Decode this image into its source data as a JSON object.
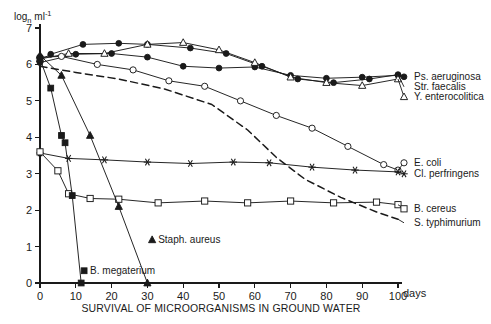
{
  "chart_data": {
    "type": "line",
    "title": "",
    "xlabel": "SURVIVAL OF MICROORGANISMS IN GROUND WATER",
    "ylabel": "log",
    "ylabel_sub": "n",
    "ylabel_unit": " ml",
    "ylabel_exp": "-1",
    "x_unit_label": "days",
    "xlim": [
      0,
      100
    ],
    "ylim": [
      0,
      7
    ],
    "grid": false,
    "legend_position": "right-inline",
    "xticks": [
      0,
      10,
      20,
      30,
      40,
      50,
      60,
      70,
      80,
      90,
      100
    ],
    "xtick_labels": [
      "0",
      "10",
      "20",
      "30",
      "40",
      "50",
      "60",
      "70",
      "80",
      "90",
      "100"
    ],
    "yticks": [
      0,
      1,
      2,
      3,
      4,
      5,
      6,
      7
    ],
    "ytick_labels": [
      "0",
      "1",
      "2",
      "3",
      "4",
      "5",
      "6",
      "7"
    ],
    "series": [
      {
        "name": "Ps. aeruginosa",
        "marker": "filled-circle",
        "linestyle": "solid",
        "label_position": "right",
        "x": [
          0,
          10,
          20,
          30,
          40,
          50,
          60,
          70,
          80,
          90,
          100
        ],
        "y": [
          6.05,
          6.28,
          6.3,
          6.2,
          5.95,
          5.9,
          5.93,
          5.7,
          5.62,
          5.65,
          5.7
        ]
      },
      {
        "name": "Str. faecalis",
        "marker": "filled-circle-dark",
        "linestyle": "solid",
        "label_position": "right",
        "x": [
          0,
          3,
          12,
          22,
          30,
          42,
          52,
          62,
          72,
          82,
          92,
          100
        ],
        "y": [
          6.12,
          6.28,
          6.55,
          6.58,
          6.55,
          6.45,
          6.3,
          5.95,
          5.6,
          5.5,
          5.6,
          5.72
        ]
      },
      {
        "name": "Y. enterocolitica",
        "marker": "open-triangle",
        "linestyle": "solid",
        "label_position": "right",
        "x": [
          0,
          8,
          18,
          30,
          40,
          50,
          60,
          70,
          80,
          90,
          100
        ],
        "y": [
          6.15,
          6.3,
          6.3,
          6.55,
          6.6,
          6.4,
          6.05,
          5.65,
          5.5,
          5.42,
          5.6
        ]
      },
      {
        "name": "E. coli",
        "marker": "open-circle",
        "linestyle": "solid",
        "label_position": "right",
        "x": [
          0,
          6,
          16,
          26,
          36,
          46,
          56,
          66,
          76,
          86,
          96,
          100
        ],
        "y": [
          6.2,
          6.22,
          6.0,
          5.85,
          5.55,
          5.4,
          5.0,
          4.6,
          4.25,
          3.75,
          3.25,
          3.1
        ]
      },
      {
        "name": "Cl. perfringens",
        "marker": "asterisk",
        "linestyle": "solid",
        "label_position": "right",
        "x": [
          0,
          8,
          18,
          30,
          42,
          54,
          64,
          76,
          88,
          100
        ],
        "y": [
          3.57,
          3.42,
          3.38,
          3.32,
          3.28,
          3.32,
          3.3,
          3.18,
          3.1,
          3.05
        ]
      },
      {
        "name": "B. cereus",
        "marker": "open-square",
        "linestyle": "solid",
        "label_position": "right",
        "x": [
          0,
          5,
          8,
          14,
          22,
          33,
          46,
          58,
          70,
          82,
          94,
          100
        ],
        "y": [
          3.6,
          3.08,
          2.45,
          2.32,
          2.3,
          2.2,
          2.25,
          2.2,
          2.25,
          2.2,
          2.22,
          2.15
        ]
      },
      {
        "name": "S. typhimurium",
        "marker": "none",
        "linestyle": "dashed",
        "label_position": "right",
        "x": [
          0,
          10,
          22,
          35,
          48,
          58,
          66,
          74,
          84,
          94,
          100
        ],
        "y": [
          5.95,
          5.78,
          5.6,
          5.32,
          4.9,
          4.2,
          3.45,
          2.85,
          2.35,
          1.95,
          1.75
        ]
      },
      {
        "name": "Staph. aureus",
        "marker": "filled-triangle",
        "linestyle": "solid",
        "label_position": "inline",
        "label_x": 33,
        "label_y": 1.2,
        "x": [
          0,
          6,
          14,
          22,
          30
        ],
        "y": [
          6.25,
          5.7,
          4.05,
          2.1,
          0.0
        ]
      },
      {
        "name": "B. megaterium",
        "marker": "filled-square",
        "linestyle": "solid",
        "label_position": "inline",
        "label_x": 14,
        "label_y": 0.35,
        "x": [
          0,
          3,
          6,
          7,
          9,
          11.5
        ],
        "y": [
          6.15,
          5.35,
          4.05,
          3.85,
          2.4,
          0.0
        ]
      }
    ],
    "legend_entries": [
      {
        "label": "Ps. aeruginosa",
        "marker": "filled-circle"
      },
      {
        "label": "Str. faecalis",
        "marker": "none"
      },
      {
        "label": "Y. enterocolitica",
        "marker": "open-triangle"
      },
      {
        "label": "E. coli",
        "marker": "open-circle"
      },
      {
        "label": "Cl. perfringens",
        "marker": "asterisk"
      },
      {
        "label": "B. cereus",
        "marker": "open-square"
      },
      {
        "label": "S. typhimurium",
        "marker": "dash"
      }
    ],
    "inline_annotations": [
      {
        "label": "Staph. aureus",
        "marker": "filled-triangle"
      },
      {
        "label": "B. megaterium",
        "marker": "filled-square"
      }
    ],
    "colors": {
      "ink": "#1a1a1a",
      "background": "#ffffff"
    }
  }
}
